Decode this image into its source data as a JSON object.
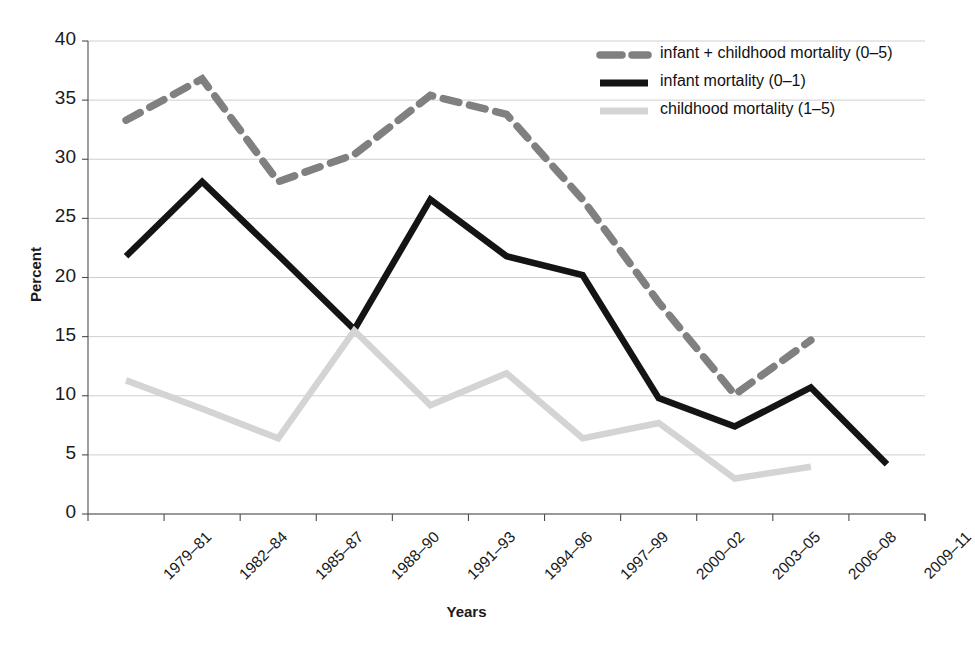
{
  "chart_data": {
    "type": "line",
    "title": "",
    "xlabel": "Years",
    "ylabel": "Percent",
    "ylim": [
      0,
      40
    ],
    "ytick_values": [
      0,
      5,
      10,
      15,
      20,
      25,
      30,
      35,
      40
    ],
    "ytick_labels": [
      "0",
      "5",
      "10",
      "15",
      "20",
      "25",
      "30",
      "35",
      "40"
    ],
    "grid": true,
    "legend_position": "top-right",
    "categories": [
      "1979–81",
      "1982–84",
      "1985–87",
      "1988–90",
      "1991–93",
      "1994–96",
      "1997–99",
      "2000–02",
      "2003–05",
      "2006–08",
      "2009–11"
    ],
    "series": [
      {
        "name": "infant + childhood mortality (0–5)",
        "style": "dashed",
        "color": "#808080",
        "values": [
          33.3,
          36.8,
          28.1,
          30.4,
          35.4,
          33.8,
          26.6,
          17.9,
          10.1,
          14.7,
          null
        ]
      },
      {
        "name": "infant mortality (0–1)",
        "style": "solid",
        "color": "#141414",
        "values": [
          21.8,
          28.1,
          21.9,
          15.6,
          26.6,
          21.8,
          20.2,
          9.8,
          7.4,
          10.7,
          4.2
        ]
      },
      {
        "name": "childhood mortality (1–5)",
        "style": "solid",
        "color": "#d4d4d4",
        "values": [
          11.3,
          8.9,
          6.4,
          15.5,
          9.2,
          11.9,
          6.4,
          7.7,
          3.0,
          4.0,
          null
        ]
      }
    ]
  },
  "legend": {
    "items": [
      {
        "label": "infant + childhood mortality (0–5)",
        "color": "#808080",
        "style": "dashed"
      },
      {
        "label": "infant mortality (0–1)",
        "color": "#141414",
        "style": "solid"
      },
      {
        "label": "childhood mortality (1–5)",
        "color": "#d4d4d4",
        "style": "solid"
      }
    ]
  },
  "axes": {
    "y_title": "Percent",
    "x_title": "Years"
  }
}
